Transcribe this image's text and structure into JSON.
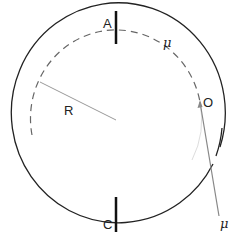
{
  "diagram": {
    "type": "circular-track",
    "labels": {
      "A": "A",
      "C": "C",
      "O": "O",
      "R": "R",
      "mu_top": "μ",
      "mu_bottom": "μ"
    },
    "colors": {
      "outer_circle": "#222222",
      "dashed_circle": "#666666",
      "radius_line": "#999999",
      "pointer_line": "#888888",
      "markers": "#111111"
    }
  }
}
